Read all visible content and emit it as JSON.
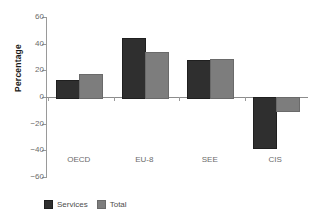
{
  "chart_data": {
    "type": "bar",
    "title": "",
    "xlabel": "",
    "ylabel": "Percentage",
    "categories": [
      "OECD",
      "EU-8",
      "SEE",
      "CIS"
    ],
    "series": [
      {
        "name": "Services",
        "color": "#2f2f2f",
        "values": [
          13,
          44.5,
          27.5,
          -37.5
        ]
      },
      {
        "name": "Total",
        "color": "#7d7d7d",
        "values": [
          17.5,
          33.5,
          28.5,
          -10
        ]
      }
    ],
    "ylim": [
      -60,
      60
    ],
    "yticks": [
      60,
      40,
      20,
      0,
      -20,
      -40,
      -60
    ],
    "ytick_labels": [
      "60",
      "40",
      "20",
      "0",
      "−20",
      "−40",
      "−60"
    ],
    "grid": false,
    "legend_position": "bottom-left",
    "zero_line": 0
  }
}
